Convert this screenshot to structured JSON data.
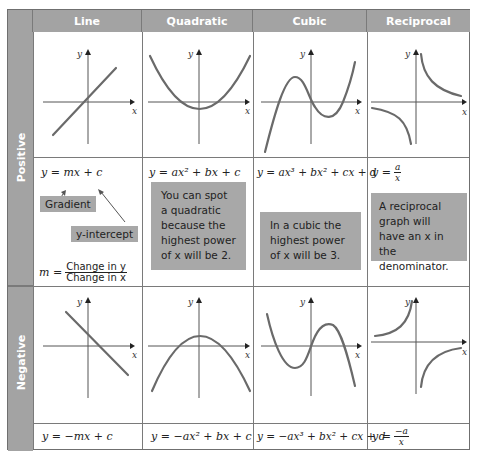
{
  "columns": [
    "Line",
    "Quadratic",
    "Cubic",
    "Reciprocal"
  ],
  "rows": {
    "positive_label": "Positive",
    "negative_label": "Negative"
  },
  "axis_labels": {
    "x": "x",
    "y": "y"
  },
  "positive": {
    "line": {
      "equation": "y = mx + c",
      "gradient_label": "Gradient",
      "intercept_label": "y-intercept",
      "m_lhs": "m =",
      "m_numerator": "Change in y",
      "m_denominator": "Change in x"
    },
    "quadratic": {
      "equation": "y = ax² + bx + c",
      "note": "You can spot a quadratic because the highest power of x will be 2."
    },
    "cubic": {
      "equation": "y = ax³ + bx² + cx + d",
      "note": "In a cubic the highest power of x will be 3."
    },
    "reciprocal": {
      "equation_lhs": "y =",
      "equation_num": "a",
      "equation_den": "x",
      "note": "A reciprocal graph will have an x in the denominator."
    }
  },
  "negative": {
    "line": {
      "equation": "y = −mx + c"
    },
    "quadratic": {
      "equation": "y = −ax² + bx + c"
    },
    "cubic": {
      "equation": "y = −ax³ + bx² + cx + d"
    },
    "reciprocal": {
      "equation_lhs": "y =",
      "equation_num": "−a",
      "equation_den": "x"
    }
  },
  "colors": {
    "header_bg": "#a3a3a3",
    "header_text": "#ffffff",
    "note_bg": "#a8a8a8",
    "curve": "#6a6a6a",
    "grid_line": "#7a7a7a"
  }
}
